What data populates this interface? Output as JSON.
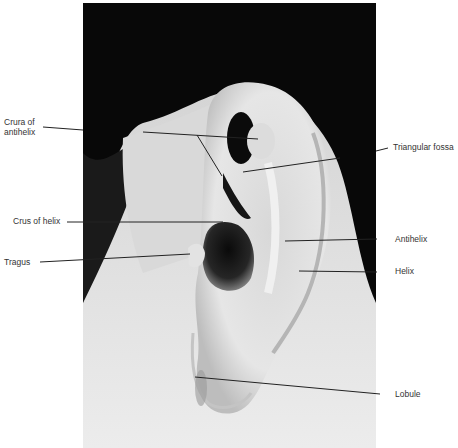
{
  "figure": {
    "labels": [
      {
        "id": "crura-of-antihelix",
        "text_line1": "Crura of",
        "text_line2": "antihelix",
        "side": "left"
      },
      {
        "id": "triangular-fossa",
        "text": "Triangular fossa",
        "side": "right"
      },
      {
        "id": "crus-of-helix",
        "text": "Crus of helix",
        "side": "left"
      },
      {
        "id": "antihelix",
        "text": "Antihelix",
        "side": "right"
      },
      {
        "id": "tragus",
        "text": "Tragus",
        "side": "left"
      },
      {
        "id": "helix",
        "text": "Helix",
        "side": "right"
      },
      {
        "id": "lobule",
        "text": "Lobule",
        "side": "right"
      }
    ]
  }
}
